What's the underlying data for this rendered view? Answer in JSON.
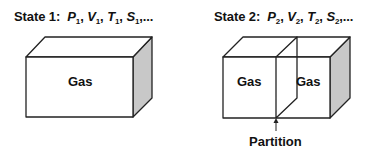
{
  "state1": {
    "label": "State 1:",
    "vars": [
      {
        "sym": "P",
        "sub": "1",
        "sep": ", "
      },
      {
        "sym": "V",
        "sub": "1",
        "sep": ", "
      },
      {
        "sym": "T",
        "sub": "1",
        "sep": ", "
      },
      {
        "sym": "S",
        "sub": "1",
        "sep": ",..."
      }
    ],
    "box_label": "Gas"
  },
  "state2": {
    "label": "State 2:",
    "vars": [
      {
        "sym": "P",
        "sub": "2",
        "sep": ", "
      },
      {
        "sym": "V",
        "sub": "2",
        "sep": ", "
      },
      {
        "sym": "T",
        "sub": "2",
        "sep": ", "
      },
      {
        "sym": "S",
        "sub": "2",
        "sep": ",..."
      }
    ],
    "box_label_left": "Gas",
    "box_label_right": "Gas",
    "partition_label": "Partition"
  },
  "colors": {
    "line": "#222222",
    "side_shade": "#c8c8c8",
    "face": "#ffffff"
  }
}
